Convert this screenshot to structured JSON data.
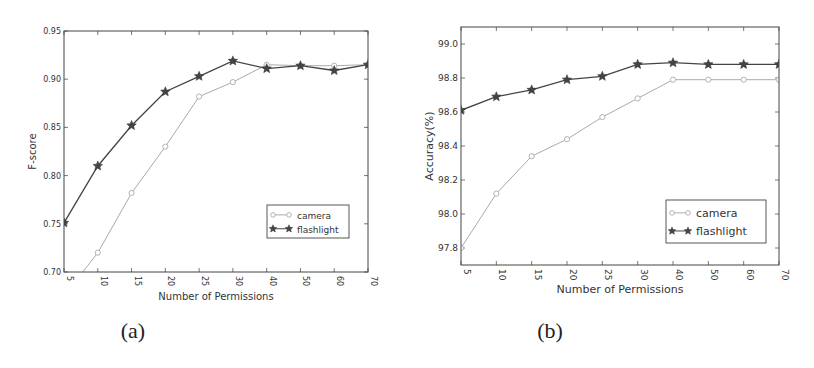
{
  "chart_data": [
    {
      "type": "line",
      "panel": "(a)",
      "title": "",
      "xlabel": "Number of Permissions",
      "ylabel": "F-score",
      "categories": [
        "5",
        "10",
        "15",
        "20",
        "25",
        "30",
        "40",
        "50",
        "60",
        "70"
      ],
      "yticks": [
        "0.70",
        "0.75",
        "0.80",
        "0.85",
        "0.90",
        "0.95"
      ],
      "ylim": [
        0.7,
        0.95
      ],
      "grid": false,
      "legend_position": "lower right",
      "series": [
        {
          "name": "camera",
          "marker": "circle-open",
          "color": "#aaaaaa",
          "values": [
            0.675,
            0.72,
            0.782,
            0.83,
            0.882,
            0.897,
            0.915,
            0.914,
            0.914,
            0.915
          ]
        },
        {
          "name": "flashlight",
          "marker": "star",
          "color": "#444444",
          "values": [
            0.751,
            0.81,
            0.852,
            0.887,
            0.903,
            0.919,
            0.911,
            0.914,
            0.909,
            0.915
          ]
        }
      ]
    },
    {
      "type": "line",
      "panel": "(b)",
      "title": "",
      "xlabel": "Number of Permissions",
      "ylabel": "Accuracy(%)",
      "categories": [
        "5",
        "10",
        "15",
        "20",
        "25",
        "30",
        "40",
        "50",
        "60",
        "70"
      ],
      "yticks": [
        "97.8",
        "98.0",
        "98.2",
        "98.4",
        "98.6",
        "98.8",
        "99.0"
      ],
      "ylim": [
        97.7,
        99.1
      ],
      "grid": false,
      "legend_position": "lower right",
      "series": [
        {
          "name": "camera",
          "marker": "circle-open",
          "color": "#aaaaaa",
          "values": [
            97.8,
            98.12,
            98.34,
            98.44,
            98.57,
            98.68,
            98.79,
            98.79,
            98.79,
            98.79
          ]
        },
        {
          "name": "flashlight",
          "marker": "star",
          "color": "#444444",
          "values": [
            98.61,
            98.69,
            98.73,
            98.79,
            98.81,
            98.88,
            98.89,
            98.88,
            98.88,
            98.88
          ]
        }
      ]
    }
  ],
  "captions": {
    "a": "(a)",
    "b": "(b)"
  }
}
